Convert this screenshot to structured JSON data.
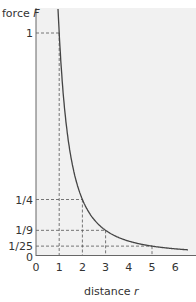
{
  "chart_data": {
    "type": "line",
    "title": "",
    "xlabel": "distance r",
    "ylabel": "force F",
    "x_ticks": [
      "0",
      "1",
      "2",
      "3",
      "4",
      "5",
      "6"
    ],
    "y_ticks": [
      "0",
      "1/25",
      "1/9",
      "1/4",
      "1"
    ],
    "xlim": [
      0,
      6.6
    ],
    "ylim": [
      0,
      1.1
    ],
    "grid": false,
    "legend": null,
    "series": [
      {
        "name": "F = 1/r^2",
        "x": [
          0.95,
          1,
          1.5,
          2,
          2.5,
          3,
          3.5,
          4,
          4.5,
          5,
          5.5,
          6,
          6.5
        ],
        "y": [
          1.108,
          1,
          0.444,
          0.25,
          0.16,
          0.111,
          0.082,
          0.0625,
          0.049,
          0.04,
          0.033,
          0.028,
          0.024
        ]
      }
    ],
    "guides": [
      {
        "x": 1,
        "y": 1,
        "label": "1"
      },
      {
        "x": 2,
        "y": 0.25,
        "label": "1/4"
      },
      {
        "x": 3,
        "y": 0.1111,
        "label": "1/9"
      },
      {
        "x": 5,
        "y": 0.04,
        "label": "1/25"
      }
    ]
  },
  "axes": {
    "y_label_text": "force ",
    "y_label_var": "F",
    "x_label_text": "distance ",
    "x_label_var": "r"
  }
}
